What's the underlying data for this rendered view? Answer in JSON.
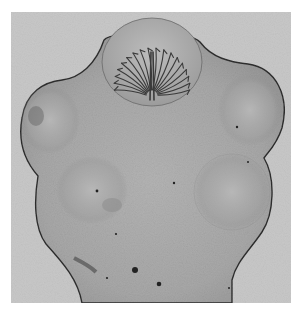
{
  "image": {
    "subject": "micrograph-of-tapeworm-scolex",
    "canvas": {
      "width": 302,
      "height": 311,
      "background": "#ffffff"
    },
    "photo_frame": {
      "x": 11,
      "y": 12,
      "width": 280,
      "height": 291,
      "color": "#c9c9c9"
    },
    "colors": {
      "background_field": "#cdcdcd",
      "body_fill": "#a9a9a9",
      "body_light": "#b8b8b8",
      "body_outline": "#2e2e2e",
      "sucker_shadow": "#8d8d8d",
      "rostellum_fill": "#b3b3b3",
      "hook_stroke": "#3a3a3a",
      "speck": "#222222"
    },
    "structures": {
      "rostellum": {
        "cx": 152,
        "cy": 60,
        "rx": 50,
        "ry": 44
      },
      "suckers": [
        {
          "name": "upper-left-sucker",
          "cx": 50,
          "cy": 120,
          "rx": 30,
          "ry": 34
        },
        {
          "name": "upper-right-sucker",
          "cx": 250,
          "cy": 110,
          "rx": 32,
          "ry": 36
        },
        {
          "name": "lower-left-sucker",
          "cx": 92,
          "cy": 190,
          "rx": 36,
          "ry": 34
        },
        {
          "name": "lower-right-sucker",
          "cx": 232,
          "cy": 192,
          "rx": 38,
          "ry": 38
        }
      ],
      "hooks_count": 18,
      "specks": [
        {
          "x": 135,
          "y": 270,
          "r": 3
        },
        {
          "x": 159,
          "y": 284,
          "r": 2.3
        },
        {
          "x": 97,
          "y": 191,
          "r": 1.4
        },
        {
          "x": 174,
          "y": 183,
          "r": 1.2
        },
        {
          "x": 237,
          "y": 127,
          "r": 1.2
        },
        {
          "x": 116,
          "y": 234,
          "r": 1.1
        },
        {
          "x": 107,
          "y": 278,
          "r": 1.1
        },
        {
          "x": 248,
          "y": 162,
          "r": 1
        },
        {
          "x": 229,
          "y": 288,
          "r": 1
        }
      ]
    }
  }
}
